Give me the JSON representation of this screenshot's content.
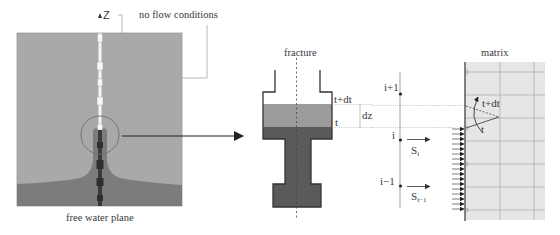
{
  "left_panel": {
    "axis_label": "Z",
    "top_annotation": "no flow conditions",
    "bottom_caption": "free water plane",
    "colors": {
      "matrix_gray": "#a8a8a8",
      "water_dark": "#7a7a7a",
      "fracture_core": "#3c3c3c",
      "fracture_empty": "#f2f2f2"
    }
  },
  "fracture_panel": {
    "title": "fracture",
    "level_upper": "t+dt",
    "level_lower": "t",
    "increment": "dz",
    "colors": {
      "light_fill": "#9a9a9a",
      "dark_fill": "#555555",
      "outline": "#333333"
    }
  },
  "node_panel": {
    "nodes": [
      {
        "label": "i+1"
      },
      {
        "label": "i"
      },
      {
        "label": "i−1"
      }
    ],
    "fluxes": [
      {
        "symbol": "S",
        "subscript": "i"
      },
      {
        "symbol": "S",
        "subscript": "i−1"
      }
    ]
  },
  "matrix_panel": {
    "title": "matrix",
    "angle_upper": "t+dt",
    "angle_lower": "t",
    "colors": {
      "fill": "#e6e6e6",
      "grid": "#9a9a9a"
    }
  }
}
